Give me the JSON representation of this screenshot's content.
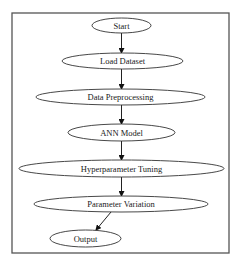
{
  "diagram": {
    "type": "flowchart",
    "frame": {
      "x": 12,
      "y": 13,
      "width": 217,
      "height": 240,
      "color": "#555555"
    },
    "stroke_color": "#333333",
    "nodes": [
      {
        "id": "start",
        "label": "Start",
        "cx": 121.5,
        "cy": 25.5,
        "rx": 29.5,
        "ry": 7.5
      },
      {
        "id": "load-dataset",
        "label": "Load Dataset",
        "cx": 122.5,
        "cy": 61,
        "rx": 60.5,
        "ry": 8
      },
      {
        "id": "data-preprocessing",
        "label": "Data Preprocessing",
        "cx": 120.5,
        "cy": 97,
        "rx": 84.5,
        "ry": 8
      },
      {
        "id": "ann-model",
        "label": "ANN Model",
        "cx": 121.5,
        "cy": 132.5,
        "rx": 53.5,
        "ry": 8.5
      },
      {
        "id": "hyperparameter-tuning",
        "label": "Hyperparameter Tuning",
        "cx": 121.5,
        "cy": 168.5,
        "rx": 102.5,
        "ry": 8.5
      },
      {
        "id": "parameter-variation",
        "label": "Parameter Variation",
        "cx": 121,
        "cy": 204,
        "rx": 87,
        "ry": 8
      },
      {
        "id": "output",
        "label": "Output",
        "cx": 85.5,
        "cy": 238.5,
        "rx": 35.5,
        "ry": 8.5
      }
    ],
    "edges": [
      {
        "from": "start",
        "to": "load-dataset",
        "x1": 121.5,
        "y1": 33,
        "x2": 121.5,
        "y2": 53
      },
      {
        "from": "load-dataset",
        "to": "data-preprocessing",
        "x1": 121.5,
        "y1": 69,
        "x2": 121.5,
        "y2": 89
      },
      {
        "from": "data-preprocessing",
        "to": "ann-model",
        "x1": 121.5,
        "y1": 105,
        "x2": 121.5,
        "y2": 124
      },
      {
        "from": "ann-model",
        "to": "hyperparameter-tuning",
        "x1": 121.5,
        "y1": 141,
        "x2": 121.5,
        "y2": 160
      },
      {
        "from": "hyperparameter-tuning",
        "to": "parameter-variation",
        "x1": 121.5,
        "y1": 177,
        "x2": 121.5,
        "y2": 196
      },
      {
        "from": "parameter-variation",
        "to": "output",
        "x1": 111,
        "y1": 212,
        "x2": 96,
        "y2": 230
      }
    ]
  }
}
